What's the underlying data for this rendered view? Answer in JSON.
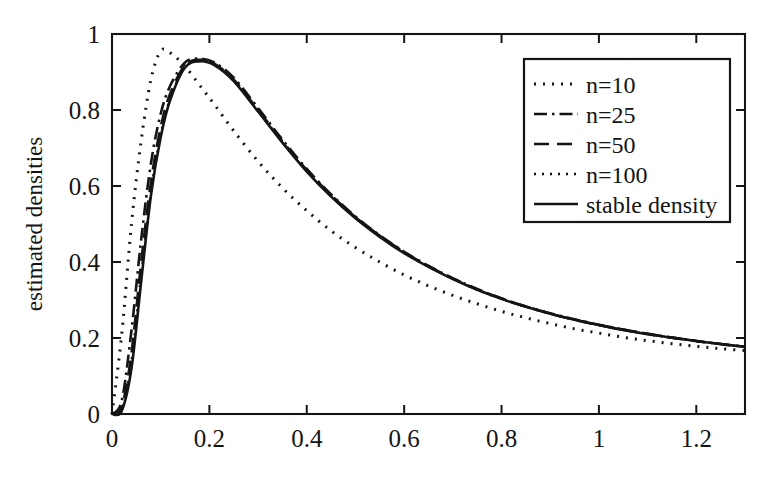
{
  "chart_data": {
    "type": "line",
    "title": "",
    "xlabel": "",
    "ylabel": "estimated densities",
    "xlim": [
      0,
      1.3
    ],
    "ylim": [
      0,
      1
    ],
    "grid": false,
    "legend_position": "upper right",
    "xticks": [
      "0",
      "0.2",
      "0.4",
      "0.6",
      "0.8",
      "1",
      "1.2"
    ],
    "xtick_values": [
      0,
      0.2,
      0.4,
      0.6,
      0.8,
      1,
      1.2
    ],
    "yticks": [
      "0",
      "0.2",
      "0.4",
      "0.6",
      "0.8",
      "1"
    ],
    "ytick_values": [
      0,
      0.2,
      0.4,
      0.6,
      0.8,
      1
    ],
    "x": [
      0,
      0.02,
      0.04,
      0.06,
      0.08,
      0.1,
      0.12,
      0.15,
      0.18,
      0.21,
      0.25,
      0.3,
      0.35,
      0.4,
      0.45,
      0.5,
      0.55,
      0.6,
      0.65,
      0.7,
      0.75,
      0.8,
      0.85,
      0.9,
      0.95,
      1.0,
      1.05,
      1.1,
      1.15,
      1.2,
      1.25,
      1.3
    ],
    "series": [
      {
        "name": "n=10",
        "style": "dotted",
        "dash": "2,7",
        "width": 3.0,
        "values": [
          0.0,
          0.21,
          0.5,
          0.72,
          0.88,
          0.955,
          0.95,
          0.915,
          0.865,
          0.815,
          0.745,
          0.665,
          0.595,
          0.535,
          0.482,
          0.438,
          0.4,
          0.366,
          0.337,
          0.312,
          0.29,
          0.27,
          0.253,
          0.238,
          0.224,
          0.213,
          0.202,
          0.193,
          0.185,
          0.178,
          0.172,
          0.167
        ]
      },
      {
        "name": "n=25",
        "style": "dash-dot",
        "dash": "13,5,2.5,5",
        "width": 2.6,
        "values": [
          0.0,
          0.035,
          0.22,
          0.46,
          0.66,
          0.79,
          0.865,
          0.925,
          0.935,
          0.925,
          0.885,
          0.805,
          0.722,
          0.645,
          0.578,
          0.52,
          0.47,
          0.427,
          0.39,
          0.357,
          0.329,
          0.304,
          0.283,
          0.265,
          0.249,
          0.235,
          0.222,
          0.211,
          0.201,
          0.192,
          0.184,
          0.177
        ]
      },
      {
        "name": "n=50",
        "style": "dashed",
        "dash": "15,8",
        "width": 2.6,
        "values": [
          0.0,
          0.018,
          0.16,
          0.4,
          0.61,
          0.755,
          0.845,
          0.918,
          0.932,
          0.922,
          0.88,
          0.8,
          0.718,
          0.642,
          0.576,
          0.518,
          0.469,
          0.426,
          0.389,
          0.357,
          0.328,
          0.304,
          0.283,
          0.264,
          0.248,
          0.234,
          0.222,
          0.211,
          0.201,
          0.192,
          0.184,
          0.177
        ]
      },
      {
        "name": "n=100",
        "style": "dotted",
        "dash": "2,6",
        "width": 2.4,
        "values": [
          0.0,
          0.012,
          0.14,
          0.37,
          0.585,
          0.735,
          0.832,
          0.915,
          0.93,
          0.92,
          0.878,
          0.798,
          0.716,
          0.64,
          0.574,
          0.516,
          0.467,
          0.424,
          0.388,
          0.356,
          0.327,
          0.303,
          0.282,
          0.264,
          0.248,
          0.234,
          0.221,
          0.21,
          0.201,
          0.192,
          0.184,
          0.177
        ]
      },
      {
        "name": "stable density",
        "style": "solid",
        "dash": "none",
        "width": 2.6,
        "values": [
          0.0,
          0.008,
          0.12,
          0.35,
          0.575,
          0.728,
          0.828,
          0.912,
          0.928,
          0.918,
          0.876,
          0.796,
          0.714,
          0.638,
          0.572,
          0.515,
          0.466,
          0.423,
          0.387,
          0.355,
          0.327,
          0.303,
          0.282,
          0.264,
          0.248,
          0.234,
          0.221,
          0.21,
          0.201,
          0.192,
          0.184,
          0.177
        ]
      }
    ]
  },
  "legend": {
    "entries": [
      {
        "label": "n=10"
      },
      {
        "label": "n=25"
      },
      {
        "label": "n=50"
      },
      {
        "label": "n=100"
      },
      {
        "label": "stable density"
      }
    ]
  }
}
